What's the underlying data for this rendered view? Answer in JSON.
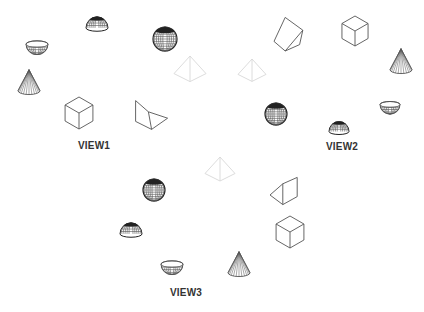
{
  "colors": {
    "background": "#ffffff",
    "wire": "#555555",
    "solid_dark": "#222222",
    "pyramid": "#d8d8d8",
    "label": "#333333"
  },
  "views": [
    {
      "label": "VIEW1",
      "label_pos": [
        94,
        146
      ],
      "objects": [
        {
          "type": "hemisphere",
          "x": 97,
          "y": 23,
          "r": 11
        },
        {
          "type": "sphere",
          "x": 165,
          "y": 39,
          "r": 12
        },
        {
          "type": "bowl",
          "x": 37,
          "y": 48,
          "r": 11
        },
        {
          "type": "cone",
          "x": 29,
          "y": 83,
          "r": 11
        },
        {
          "type": "cube",
          "x": 79,
          "y": 113,
          "s": 16
        },
        {
          "type": "wedge",
          "x": 150,
          "y": 115,
          "s": 16,
          "variant": "v1"
        },
        {
          "type": "pyramid",
          "x": 190,
          "y": 72,
          "s": 16
        }
      ]
    },
    {
      "label": "VIEW2",
      "label_pos": [
        342,
        147
      ],
      "objects": [
        {
          "type": "wedge",
          "x": 290,
          "y": 35,
          "s": 16,
          "variant": "v2"
        },
        {
          "type": "cube",
          "x": 355,
          "y": 31,
          "s": 15
        },
        {
          "type": "cone",
          "x": 401,
          "y": 62,
          "r": 11
        },
        {
          "type": "pyramid",
          "x": 252,
          "y": 73,
          "s": 14
        },
        {
          "type": "sphere",
          "x": 276,
          "y": 114,
          "r": 11
        },
        {
          "type": "hemisphere",
          "x": 339,
          "y": 127,
          "r": 10
        },
        {
          "type": "bowl",
          "x": 390,
          "y": 108,
          "r": 10
        }
      ]
    },
    {
      "label": "VIEW3",
      "label_pos": [
        186,
        293
      ],
      "objects": [
        {
          "type": "pyramid",
          "x": 220,
          "y": 172,
          "s": 15
        },
        {
          "type": "sphere",
          "x": 154,
          "y": 190,
          "r": 11
        },
        {
          "type": "hemisphere",
          "x": 131,
          "y": 229,
          "r": 11
        },
        {
          "type": "bowl",
          "x": 172,
          "y": 268,
          "r": 11
        },
        {
          "type": "cone",
          "x": 239,
          "y": 265,
          "r": 11
        },
        {
          "type": "wedge",
          "x": 286,
          "y": 195,
          "s": 16,
          "variant": "v3"
        },
        {
          "type": "cube",
          "x": 290,
          "y": 232,
          "s": 16
        }
      ]
    }
  ]
}
